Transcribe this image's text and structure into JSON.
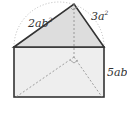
{
  "figure": {
    "type": "triangular-prism",
    "labels": {
      "hypotenuse_left": {
        "base": "2ab",
        "exp": "2"
      },
      "hypotenuse_right": {
        "base": "3a",
        "exp": "2"
      },
      "height": {
        "base": "5ab",
        "exp": ""
      }
    },
    "colors": {
      "stroke": "#333333",
      "fill_front": "#eeeeee",
      "fill_top": "#dddddd",
      "dashed": "#888888",
      "circle": "#aaaaaa"
    },
    "right_angle_markers": [
      "apex",
      "hidden-vertex"
    ]
  }
}
